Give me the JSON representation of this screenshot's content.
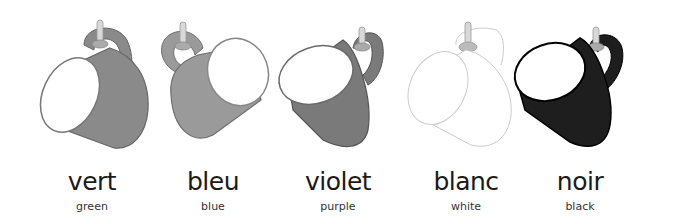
{
  "items": [
    {
      "word": "vert",
      "translation": "green",
      "color": "#8a8a8a",
      "stroke": "#666666",
      "rim": "#777777"
    },
    {
      "word": "bleu",
      "translation": "blue",
      "color": "#9a9a9a",
      "stroke": "#6e6e6e",
      "rim": "#888888"
    },
    {
      "word": "violet",
      "translation": "purple",
      "color": "#7a7a7a",
      "stroke": "#555555",
      "rim": "#6a6a6a"
    },
    {
      "word": "blanc",
      "translation": "white",
      "color": "#ffffff",
      "stroke": "#cccccc",
      "rim": "#dddddd"
    },
    {
      "word": "noir",
      "translation": "black",
      "color": "#1e1e1e",
      "stroke": "#000000",
      "rim": "#111111"
    }
  ]
}
